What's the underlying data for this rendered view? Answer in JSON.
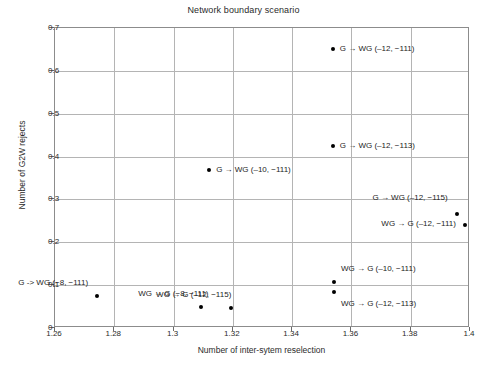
{
  "chart_data": {
    "type": "scatter",
    "title": "Network boundary scenario",
    "xlabel": "Number of inter-sytem reselection",
    "ylabel": "Number of G2W rejects",
    "xlim": [
      1.26,
      1.4
    ],
    "ylim": [
      0,
      0.7
    ],
    "xticks": [
      "1.26",
      "1.28",
      "1.3",
      "1.32",
      "1.34",
      "1.36",
      "1.38",
      "1.4"
    ],
    "xtick_values": [
      1.26,
      1.28,
      1.3,
      1.32,
      1.34,
      1.36,
      1.38,
      1.4
    ],
    "yticks": [
      "0",
      "0.1",
      "0.2",
      "0.3",
      "0.4",
      "0.5",
      "0.6",
      "0.7"
    ],
    "ytick_values": [
      0,
      0.1,
      0.2,
      0.3,
      0.4,
      0.5,
      0.6,
      0.7
    ],
    "grid": true,
    "legend": "none",
    "marker_color": "#000000",
    "points": [
      {
        "label": "G → WG (‒12, −111)",
        "x": 1.3537,
        "y": 0.651,
        "label_side": "right"
      },
      {
        "label": "G → WG (‒12, −113)",
        "x": 1.3537,
        "y": 0.425,
        "label_side": "right"
      },
      {
        "label": "G → WG (‒10, −111)",
        "x": 1.312,
        "y": 0.369,
        "label_side": "right"
      },
      {
        "label": "G → WG (‒12, −115)",
        "x": 1.3955,
        "y": 0.266,
        "label_side": "left"
      },
      {
        "label": "WG → G (‒12, −111)",
        "x": 1.3983,
        "y": 0.24,
        "label_side": "left"
      },
      {
        "label": "WG → G (‒10, −111)",
        "x": 1.3541,
        "y": 0.107,
        "label_side": "right"
      },
      {
        "label": "WG → G (‒12, −113)",
        "x": 1.3541,
        "y": 0.084,
        "label_side": "right"
      },
      {
        "label": "G -> WG (−8, −111)",
        "x": 1.2742,
        "y": 0.075,
        "label_side": "left"
      },
      {
        "label": "WG → G (−8, −111)",
        "x": 1.3093,
        "y": 0.049,
        "label_side": "right"
      },
      {
        "label": "WG → G (‒12, −115)",
        "x": 1.3194,
        "y": 0.047,
        "label_side": "right"
      }
    ],
    "label_offsets": [
      {
        "dx": 8,
        "dy": 0
      },
      {
        "dx": 8,
        "dy": 0
      },
      {
        "dx": 8,
        "dy": 0
      },
      {
        "dx": -8,
        "dy": -16
      },
      {
        "dx": -8,
        "dy": -1
      },
      {
        "dx": 8,
        "dy": -13
      },
      {
        "dx": 8,
        "dy": 12
      },
      {
        "dx": -8,
        "dy": -13
      },
      {
        "dx": -62,
        "dy": -13
      },
      {
        "dx": -74,
        "dy": -13
      }
    ]
  }
}
